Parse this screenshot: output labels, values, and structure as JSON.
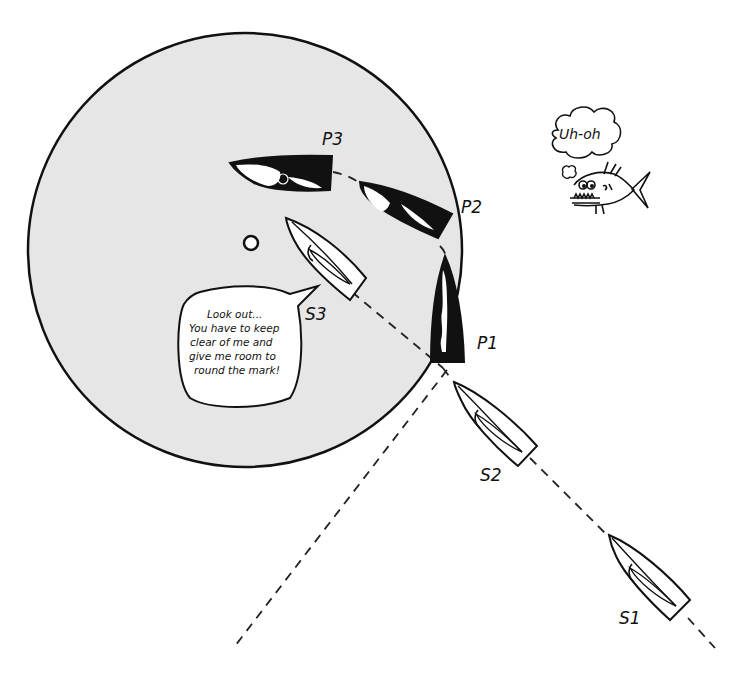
{
  "diagram": {
    "type": "sailing-rules-illustration",
    "colors": {
      "zone_fill": "#e6e6e6",
      "stroke": "#111111",
      "port_boat_fill": "#111111",
      "starboard_boat_fill": "#ffffff",
      "background": "#ffffff"
    },
    "zone": {
      "cx": 245,
      "cy": 250,
      "r": 217
    },
    "mark": {
      "cx": 251,
      "cy": 243,
      "r": 7
    },
    "boats": [
      {
        "id": "P1",
        "label": "P1",
        "tack": "port",
        "color": "black"
      },
      {
        "id": "P2",
        "label": "P2",
        "tack": "port",
        "color": "black"
      },
      {
        "id": "P3",
        "label": "P3",
        "tack": "port",
        "color": "black"
      },
      {
        "id": "S1",
        "label": "S1",
        "tack": "starboard",
        "color": "white"
      },
      {
        "id": "S2",
        "label": "S2",
        "tack": "starboard",
        "color": "white"
      },
      {
        "id": "S3",
        "label": "S3",
        "tack": "starboard",
        "color": "white"
      }
    ],
    "speech_bubble": {
      "speaker": "S3",
      "lines": [
        "Look out...",
        "You have to keep",
        "clear of me and",
        "give me room to",
        "round the mark!"
      ]
    },
    "thought_bubble": {
      "thinker": "fish",
      "text": "Uh-oh"
    }
  }
}
